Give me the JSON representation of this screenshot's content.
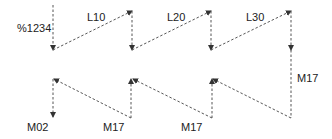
{
  "diagram": {
    "line_color": "#555555",
    "text_color": "#222222",
    "labels": {
      "start": "%1234",
      "end": "M02",
      "top_moves": [
        "L10",
        "L20",
        "L30"
      ],
      "return_right": "M17",
      "bottom_returns": [
        "M17",
        "M17"
      ]
    },
    "edges": [
      {
        "from": "start",
        "to": "p1",
        "style": "dashed",
        "arrow": "down"
      },
      {
        "from": "p1",
        "to": "p2",
        "label": "L10",
        "style": "dashed",
        "arrow": "up-right"
      },
      {
        "from": "p2",
        "to": "p3",
        "style": "dashed",
        "arrow": "down"
      },
      {
        "from": "p3",
        "to": "p4",
        "label": "L20",
        "style": "dashed",
        "arrow": "up-right"
      },
      {
        "from": "p4",
        "to": "p5",
        "style": "dashed",
        "arrow": "down"
      },
      {
        "from": "p5",
        "to": "p6",
        "label": "L30",
        "style": "dashed",
        "arrow": "up-right"
      },
      {
        "from": "p6",
        "to": "p7",
        "label": "M17",
        "style": "dashed",
        "arrow": "down"
      },
      {
        "from": "p7",
        "to": "p8",
        "style": "dashed",
        "arrow": "up-left"
      },
      {
        "from": "p8",
        "to": "p9",
        "style": "dashed",
        "arrow": "up"
      },
      {
        "from": "p9",
        "to": "p10",
        "label": "M17",
        "style": "dashed",
        "arrow": "up-left"
      },
      {
        "from": "p10",
        "to": "p11",
        "style": "dashed",
        "arrow": "up"
      },
      {
        "from": "p11",
        "to": "p12",
        "label": "M17",
        "style": "dashed",
        "arrow": "up-left"
      },
      {
        "from": "p12",
        "to": "end",
        "label": "M02",
        "style": "dashed",
        "arrow": "down"
      }
    ]
  }
}
